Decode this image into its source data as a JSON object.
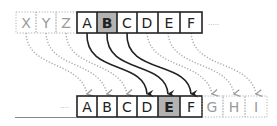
{
  "diagram": {
    "shift": 3,
    "top_row": {
      "ghost_cells": [
        "X",
        "Y",
        "Z"
      ],
      "cells": [
        "A",
        "B",
        "C",
        "D",
        "E",
        "F"
      ],
      "highlighted": "B",
      "ellipsis": "....."
    },
    "bottom_row": {
      "ellipsis": "....",
      "cells": [
        "A",
        "B",
        "C",
        "D",
        "E",
        "F"
      ],
      "ghost_cells": [
        "G",
        "H",
        "I"
      ],
      "highlighted": "E"
    },
    "solid_arrows": [
      {
        "from": "A",
        "to": "D"
      },
      {
        "from": "B",
        "to": "E"
      },
      {
        "from": "C",
        "to": "F"
      }
    ],
    "dotted_arrows": [
      {
        "from": "X",
        "to": "A"
      },
      {
        "from": "Y",
        "to": "B"
      },
      {
        "from": "Z",
        "to": "C"
      },
      {
        "from": "D",
        "to": "G"
      },
      {
        "from": "E",
        "to": "H"
      },
      {
        "from": "F",
        "to": "I"
      }
    ],
    "colors": {
      "solid": "#222222",
      "ghost": "#9a9a9a",
      "highlight_fill": "#b3b3b3"
    }
  }
}
